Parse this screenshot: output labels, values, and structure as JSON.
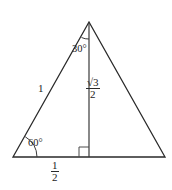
{
  "figure": {
    "type": "geometry-diagram",
    "width": 172,
    "height": 190,
    "background_color": "#ffffff",
    "stroke_color": "#2a2a2a",
    "text_color": "#1d1d1d"
  },
  "vertices": {
    "apex": {
      "x": 89,
      "y": 22
    },
    "bottom_left": {
      "x": 13,
      "y": 157
    },
    "bottom_right": {
      "x": 165,
      "y": 157
    },
    "altitude_foot": {
      "x": 89,
      "y": 157
    }
  },
  "labels": {
    "angle_apex": "30°",
    "angle_base_left": "60°",
    "side_left": "1",
    "altitude_numerator": "√3",
    "altitude_denominator": "2",
    "halfbase_numerator": "1",
    "halfbase_denominator": "2"
  },
  "markers": {
    "right_angle": "right-angle-square",
    "arc_apex": "angle-arc-30",
    "arc_base": "angle-arc-60"
  }
}
